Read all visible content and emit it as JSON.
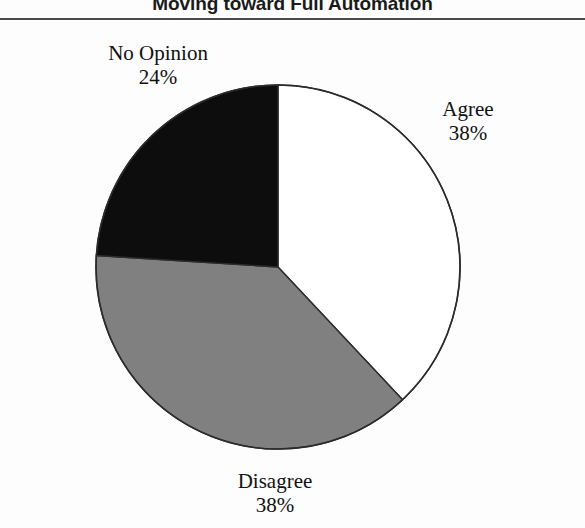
{
  "title": "Moving toward Full Automation",
  "colors": {
    "background": "#fdfdfd",
    "rule": "#4a4a4a",
    "outline": "#2b2b2b",
    "agree": "#ffffff",
    "disagree": "#808080",
    "no_opinion": "#0d0d0d",
    "text": "#111111"
  },
  "labels": {
    "agree": {
      "name": "Agree",
      "value": "38%"
    },
    "disagree": {
      "name": "Disagree",
      "value": "38%"
    },
    "no_opinion": {
      "name": "No Opinion",
      "value": "24%"
    }
  },
  "chart_data": {
    "type": "pie",
    "title": "Moving toward Full Automation",
    "xlabel": "",
    "ylabel": "",
    "unit": "percent",
    "start_angle_deg": 0,
    "direction": "clockwise",
    "legend": "none",
    "grid": false,
    "categories": [
      "Agree",
      "Disagree",
      "No Opinion"
    ],
    "values": [
      38,
      38,
      24
    ],
    "slices": [
      {
        "label": "Agree",
        "value": 38,
        "display": "38%",
        "color": "#ffffff",
        "sweep_deg": 136.8,
        "start_deg": 0
      },
      {
        "label": "Disagree",
        "value": 38,
        "display": "38%",
        "color": "#808080",
        "sweep_deg": 136.8,
        "start_deg": 136.8
      },
      {
        "label": "No Opinion",
        "value": 24,
        "display": "24%",
        "color": "#0d0d0d",
        "sweep_deg": 86.4,
        "start_deg": 273.6
      }
    ]
  }
}
